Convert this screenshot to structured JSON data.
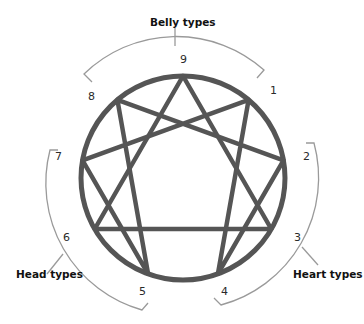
{
  "diagram": {
    "type": "enneagram",
    "colors": {
      "figure": "#555555",
      "bracket": "#9a9a9a",
      "text": "#111111"
    },
    "points": [
      {
        "id": "9",
        "label": "9"
      },
      {
        "id": "1",
        "label": "1"
      },
      {
        "id": "2",
        "label": "2"
      },
      {
        "id": "3",
        "label": "3"
      },
      {
        "id": "4",
        "label": "4"
      },
      {
        "id": "5",
        "label": "5"
      },
      {
        "id": "6",
        "label": "6"
      },
      {
        "id": "7",
        "label": "7"
      },
      {
        "id": "8",
        "label": "8"
      }
    ],
    "triangle": [
      "9",
      "3",
      "6"
    ],
    "hexad": [
      "1",
      "4",
      "2",
      "8",
      "5",
      "7"
    ],
    "groups": [
      {
        "name": "belly",
        "label": "Belly types",
        "members": [
          "8",
          "9",
          "1"
        ]
      },
      {
        "name": "heart",
        "label": "Heart types",
        "members": [
          "2",
          "3",
          "4"
        ]
      },
      {
        "name": "head",
        "label": "Head types",
        "members": [
          "5",
          "6",
          "7"
        ]
      }
    ]
  }
}
